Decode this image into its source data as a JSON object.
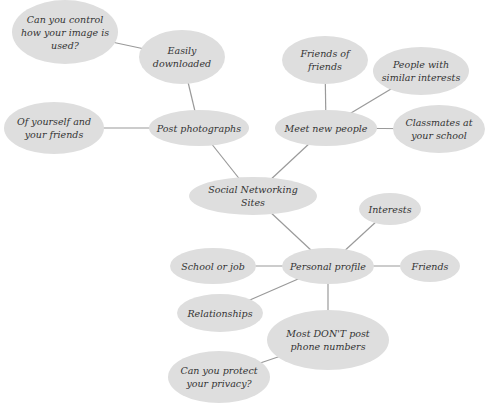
{
  "diagram": {
    "title": "Social Networking Sites",
    "colors": {
      "node_fill": "#dedede",
      "line": "#9a9a9a",
      "text": "#333333",
      "background": "#ffffff"
    },
    "nodes": [
      {
        "id": "center",
        "label": "Social Networking Sites",
        "cx": 253,
        "cy": 196,
        "rx": 64,
        "ry": 19
      },
      {
        "id": "post",
        "label": "Post photographs",
        "cx": 199,
        "cy": 128,
        "rx": 50,
        "ry": 18
      },
      {
        "id": "easily",
        "label": "Easily downloaded",
        "cx": 182,
        "cy": 57,
        "rx": 43,
        "ry": 27
      },
      {
        "id": "control",
        "label": "Can you control how your image is used?",
        "cx": 65,
        "cy": 32,
        "rx": 53,
        "ry": 32
      },
      {
        "id": "yourself",
        "label": "Of yourself and your friends",
        "cx": 54,
        "cy": 128,
        "rx": 50,
        "ry": 26
      },
      {
        "id": "meet",
        "label": "Meet new people",
        "cx": 326,
        "cy": 128,
        "rx": 51,
        "ry": 18
      },
      {
        "id": "fof",
        "label": "Friends of friends",
        "cx": 325,
        "cy": 60,
        "rx": 43,
        "ry": 24
      },
      {
        "id": "similar",
        "label": "People with similar interests",
        "cx": 421,
        "cy": 71,
        "rx": 48,
        "ry": 24
      },
      {
        "id": "classmates",
        "label": "Classmates at your school",
        "cx": 439,
        "cy": 129,
        "rx": 46,
        "ry": 24
      },
      {
        "id": "profile",
        "label": "Personal profile",
        "cx": 328,
        "cy": 266,
        "rx": 46,
        "ry": 18
      },
      {
        "id": "interests",
        "label": "Interests",
        "cx": 390,
        "cy": 209,
        "rx": 31,
        "ry": 16
      },
      {
        "id": "friends",
        "label": "Friends",
        "cx": 430,
        "cy": 266,
        "rx": 30,
        "ry": 16
      },
      {
        "id": "school",
        "label": "School or job",
        "cx": 213,
        "cy": 266,
        "rx": 43,
        "ry": 18
      },
      {
        "id": "relationships",
        "label": "Relationships",
        "cx": 220,
        "cy": 313,
        "rx": 43,
        "ry": 19
      },
      {
        "id": "phone",
        "label": "Most DON'T post phone numbers",
        "cx": 328,
        "cy": 340,
        "rx": 61,
        "ry": 30
      },
      {
        "id": "privacy",
        "label": "Can you protect your privacy?",
        "cx": 219,
        "cy": 377,
        "rx": 51,
        "ry": 26
      }
    ],
    "edges": [
      [
        "center",
        "post"
      ],
      [
        "post",
        "easily"
      ],
      [
        "easily",
        "control"
      ],
      [
        "post",
        "yourself"
      ],
      [
        "center",
        "meet"
      ],
      [
        "meet",
        "fof"
      ],
      [
        "meet",
        "similar"
      ],
      [
        "meet",
        "classmates"
      ],
      [
        "center",
        "profile"
      ],
      [
        "profile",
        "interests"
      ],
      [
        "profile",
        "friends"
      ],
      [
        "profile",
        "school"
      ],
      [
        "profile",
        "relationships"
      ],
      [
        "profile",
        "phone"
      ],
      [
        "phone",
        "privacy"
      ]
    ]
  }
}
